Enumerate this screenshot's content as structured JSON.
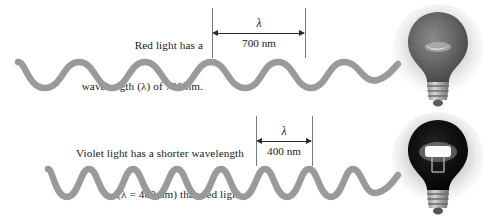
{
  "figure": {
    "background_color": "#ffffff",
    "text_color": "#1a1a1a",
    "wave_color": "#9a9a9a"
  },
  "red_light": {
    "caption_line_1": "Red light has a",
    "caption_line_2": "wavelength (λ) of 700 nm.",
    "dimension": {
      "symbol": "λ",
      "value": "700 nm"
    },
    "bulb_name": "light-bulb-red",
    "wave": {
      "cycles": 4.5,
      "period_px": 67,
      "amplitude_px": 13
    }
  },
  "violet_light": {
    "caption_line_1": "Violet light has a shorter wavelength",
    "caption_line_2": "(λ = 400 nm) than red light.",
    "dimension": {
      "symbol": "λ",
      "value": "400 nm"
    },
    "bulb_name": "light-bulb-violet",
    "wave": {
      "cycles": 8,
      "period_px": 38,
      "amplitude_px": 13
    }
  }
}
